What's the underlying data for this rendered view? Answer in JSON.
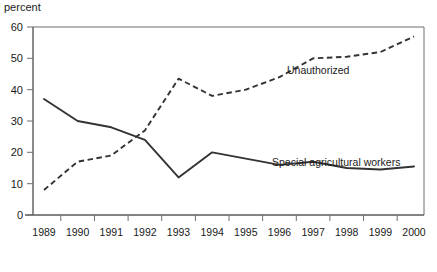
{
  "chart_data": {
    "type": "line",
    "title": "",
    "ylabel": "percent",
    "xlabel": "",
    "ylim": [
      0,
      60
    ],
    "ytick_labels": [
      "0",
      "10",
      "20",
      "30",
      "40",
      "50",
      "60"
    ],
    "ytick_values": [
      0,
      10,
      20,
      30,
      40,
      50,
      60
    ],
    "grid": false,
    "legend": "inline-annotations",
    "categories": [
      "1989",
      "1990",
      "1991",
      "1992",
      "1993",
      "1994",
      "1995",
      "1996",
      "1997",
      "1998",
      "1999",
      "2000"
    ],
    "x": [
      1989,
      1990,
      1991,
      1992,
      1993,
      1994,
      1995,
      1996,
      1997,
      1998,
      1999,
      2000
    ],
    "series": [
      {
        "name": "Unauthorized",
        "style": "dashed",
        "color": "#333333",
        "values": [
          8,
          17,
          19,
          27,
          43.5,
          38,
          40,
          44,
          50,
          50.5,
          52,
          57
        ]
      },
      {
        "name": "Special agricultural workers",
        "style": "solid",
        "color": "#333333",
        "values": [
          37,
          30,
          28,
          24,
          12,
          20,
          18,
          16,
          17,
          15,
          14.5,
          15.5
        ]
      }
    ],
    "annotations": [
      {
        "text": "Unauthorized",
        "x_px": 287,
        "y_px": 74
      },
      {
        "text": "Special agricultural workers",
        "x_px": 272,
        "y_px": 166
      }
    ]
  }
}
